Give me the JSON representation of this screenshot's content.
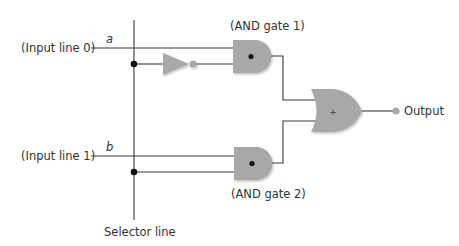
{
  "diagram": {
    "inputs": [
      {
        "label": "(Input line 0)",
        "variable": "a"
      },
      {
        "label": "(Input line 1)",
        "variable": "b"
      }
    ],
    "gates": [
      {
        "type": "NOT",
        "label": ""
      },
      {
        "type": "AND",
        "label": "(AND gate 1)",
        "symbol": "•"
      },
      {
        "type": "AND",
        "label": "(AND gate 2)",
        "symbol": "•"
      },
      {
        "type": "OR",
        "label": "",
        "symbol": "+"
      }
    ],
    "selector_label": "Selector line",
    "output_label": "Output",
    "colors": {
      "gate_fill": "#a8a8a8",
      "wire": "#3a3a3a",
      "junction": "#111111",
      "bubble": "#a8a8a8"
    }
  }
}
